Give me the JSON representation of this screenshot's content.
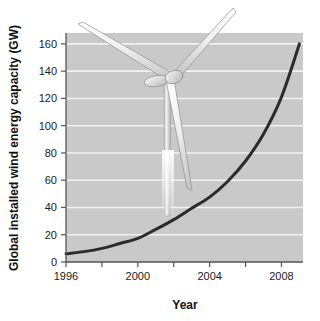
{
  "chart_data": {
    "type": "line",
    "title": "",
    "xlabel": "Year",
    "ylabel": "Global installed wind energy capacity (GW)",
    "xlim": [
      1996,
      2009.2
    ],
    "ylim": [
      0,
      168
    ],
    "grid": true,
    "legend": "none",
    "xticks": [
      1996,
      1998,
      2000,
      2002,
      2004,
      2006,
      2008
    ],
    "xtick_labels": [
      "1996",
      "",
      "2000",
      "",
      "2004",
      "",
      "2008"
    ],
    "yticks": [
      0,
      20,
      40,
      60,
      80,
      100,
      120,
      140,
      160
    ],
    "ytick_labels": [
      "0",
      "20",
      "40",
      "60",
      "80",
      "100",
      "120",
      "140",
      "160"
    ],
    "x": [
      1996,
      1997,
      1998,
      1999,
      2000,
      2001,
      2002,
      2003,
      2004,
      2005,
      2006,
      2007,
      2008,
      2009
    ],
    "values": [
      6,
      7.6,
      10,
      13.6,
      17.4,
      23.9,
      31.1,
      39.4,
      47.6,
      59.1,
      74.1,
      93.9,
      121,
      160
    ],
    "series": [
      {
        "name": "Global installed wind energy capacity",
        "values": [
          6,
          7.6,
          10,
          13.6,
          17.4,
          23.9,
          31.1,
          39.4,
          47.6,
          59.1,
          74.1,
          93.9,
          121,
          160
        ]
      }
    ],
    "annotations": [
      "wind-turbine illustration overlaying plot area"
    ]
  },
  "axes": {
    "y_title": "Global installed wind energy capacity (GW)",
    "x_title": "Year",
    "y_tick_labels": [
      "0",
      "20",
      "40",
      "60",
      "80",
      "100",
      "120",
      "140",
      "160"
    ],
    "x_tick_labels": [
      "1996",
      "2000",
      "2004",
      "2008"
    ]
  },
  "style": {
    "plot_background": "#c9c9c9",
    "gridline_color": "#f2f2f2",
    "line_color": "#2b2b2b",
    "axis_color": "#555555",
    "text_color": "#111111",
    "page_background": "#ffffff",
    "turbine_color": "#e8e8e8",
    "turbine_outline": "#8d8d8d"
  },
  "decoration": {
    "turbine_name": "wind-turbine-illustration"
  }
}
